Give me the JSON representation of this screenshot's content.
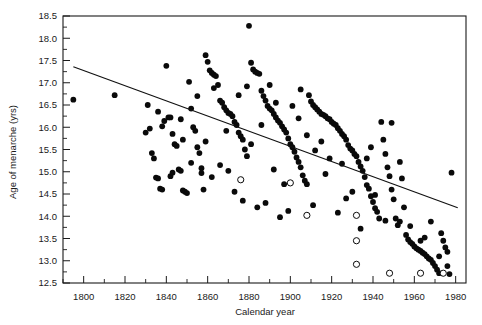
{
  "chart_data": {
    "type": "scatter",
    "title": "",
    "xlabel": "Calendar year",
    "ylabel": "Age of menarche (yrs)",
    "xlim": [
      1790,
      1985
    ],
    "ylim": [
      12.5,
      18.5
    ],
    "xticks": [
      1800,
      1820,
      1840,
      1860,
      1880,
      1900,
      1920,
      1940,
      1960,
      1980
    ],
    "xtick_labels": [
      "1800",
      "1820",
      "1840",
      "1860",
      "1880",
      "1900",
      "1920",
      "1940",
      "1960",
      "1980"
    ],
    "xminor_step": 10,
    "yticks": [
      12.5,
      13.0,
      13.5,
      14.0,
      14.5,
      15.0,
      15.5,
      16.0,
      16.5,
      17.0,
      17.5,
      18.0,
      18.5
    ],
    "ytick_labels": [
      "12.5",
      "13.0",
      "13.5",
      "14.0",
      "14.5",
      "15.0",
      "15.5",
      "16.0",
      "16.5",
      "17.0",
      "17.5",
      "18.0",
      "18.5"
    ],
    "grid": false,
    "legend": "none",
    "marker_colors": {
      "filled": "#0a0a0a",
      "open_fill": "#ffffff",
      "open_stroke": "#0a0a0a",
      "line": "#111111"
    },
    "trend_line": {
      "label": "linear regression fit",
      "x_start": 1795,
      "y_start": 17.36,
      "x_end": 1981,
      "y_end": 14.19
    },
    "series": [
      {
        "name": "filled-circles",
        "marker": "filled-circle",
        "points": [
          [
            1795,
            16.62
          ],
          [
            1815,
            16.72
          ],
          [
            1831,
            16.5
          ],
          [
            1832,
            15.97
          ],
          [
            1833,
            15.42
          ],
          [
            1834,
            15.3
          ],
          [
            1835,
            14.87
          ],
          [
            1836,
            14.85
          ],
          [
            1837,
            14.62
          ],
          [
            1838,
            14.6
          ],
          [
            1839,
            16.14
          ],
          [
            1840,
            17.38
          ],
          [
            1841,
            16.22
          ],
          [
            1842,
            16.22
          ],
          [
            1843,
            15.85
          ],
          [
            1844,
            15.62
          ],
          [
            1845,
            15.58
          ],
          [
            1846,
            15.05
          ],
          [
            1847,
            15.02
          ],
          [
            1848,
            14.58
          ],
          [
            1849,
            14.55
          ],
          [
            1850,
            14.52
          ],
          [
            1851,
            17.02
          ],
          [
            1852,
            16.42
          ],
          [
            1853,
            16.0
          ],
          [
            1854,
            15.92
          ],
          [
            1855,
            15.55
          ],
          [
            1856,
            15.42
          ],
          [
            1857,
            14.97
          ],
          [
            1858,
            14.6
          ],
          [
            1859,
            17.62
          ],
          [
            1860,
            17.47
          ],
          [
            1861,
            17.28
          ],
          [
            1862,
            17.22
          ],
          [
            1863,
            17.18
          ],
          [
            1864,
            17.15
          ],
          [
            1865,
            16.95
          ],
          [
            1866,
            16.6
          ],
          [
            1867,
            16.55
          ],
          [
            1868,
            16.45
          ],
          [
            1869,
            16.38
          ],
          [
            1870,
            16.32
          ],
          [
            1871,
            16.3
          ],
          [
            1872,
            16.25
          ],
          [
            1873,
            16.12
          ],
          [
            1874,
            16.05
          ],
          [
            1875,
            15.88
          ],
          [
            1876,
            15.8
          ],
          [
            1877,
            15.72
          ],
          [
            1878,
            15.5
          ],
          [
            1879,
            15.35
          ],
          [
            1880,
            18.28
          ],
          [
            1881,
            17.45
          ],
          [
            1882,
            17.3
          ],
          [
            1883,
            17.25
          ],
          [
            1884,
            17.22
          ],
          [
            1885,
            17.2
          ],
          [
            1886,
            16.82
          ],
          [
            1887,
            16.7
          ],
          [
            1888,
            16.6
          ],
          [
            1889,
            16.48
          ],
          [
            1890,
            16.42
          ],
          [
            1891,
            16.38
          ],
          [
            1892,
            16.3
          ],
          [
            1893,
            16.22
          ],
          [
            1894,
            16.15
          ],
          [
            1895,
            16.1
          ],
          [
            1896,
            16.02
          ],
          [
            1897,
            15.95
          ],
          [
            1898,
            15.88
          ],
          [
            1899,
            15.75
          ],
          [
            1900,
            15.62
          ],
          [
            1901,
            15.55
          ],
          [
            1902,
            15.45
          ],
          [
            1903,
            15.32
          ],
          [
            1904,
            15.22
          ],
          [
            1905,
            15.1
          ],
          [
            1906,
            14.92
          ],
          [
            1907,
            14.8
          ],
          [
            1908,
            14.72
          ],
          [
            1909,
            16.72
          ],
          [
            1910,
            16.58
          ],
          [
            1911,
            16.5
          ],
          [
            1912,
            16.45
          ],
          [
            1913,
            16.4
          ],
          [
            1914,
            16.35
          ],
          [
            1915,
            16.3
          ],
          [
            1916,
            16.28
          ],
          [
            1917,
            16.25
          ],
          [
            1918,
            16.2
          ],
          [
            1919,
            16.18
          ],
          [
            1920,
            16.12
          ],
          [
            1921,
            16.08
          ],
          [
            1922,
            16.05
          ],
          [
            1923,
            15.98
          ],
          [
            1924,
            15.92
          ],
          [
            1925,
            15.85
          ],
          [
            1926,
            15.8
          ],
          [
            1927,
            15.72
          ],
          [
            1928,
            15.6
          ],
          [
            1929,
            15.52
          ],
          [
            1930,
            15.48
          ],
          [
            1931,
            15.4
          ],
          [
            1932,
            15.35
          ],
          [
            1933,
            15.22
          ],
          [
            1934,
            15.12
          ],
          [
            1935,
            15.02
          ],
          [
            1936,
            14.88
          ],
          [
            1937,
            14.7
          ],
          [
            1938,
            14.62
          ],
          [
            1939,
            14.45
          ],
          [
            1940,
            14.32
          ],
          [
            1941,
            14.18
          ],
          [
            1942,
            14.1
          ],
          [
            1943,
            13.95
          ],
          [
            1944,
            16.12
          ],
          [
            1945,
            15.72
          ],
          [
            1946,
            15.4
          ],
          [
            1947,
            15.1
          ],
          [
            1948,
            14.9
          ],
          [
            1949,
            14.6
          ],
          [
            1950,
            14.38
          ],
          [
            1951,
            13.95
          ],
          [
            1952,
            13.8
          ],
          [
            1953,
            15.22
          ],
          [
            1954,
            14.85
          ],
          [
            1955,
            14.2
          ],
          [
            1956,
            13.58
          ],
          [
            1957,
            13.48
          ],
          [
            1958,
            13.42
          ],
          [
            1959,
            13.38
          ],
          [
            1960,
            13.32
          ],
          [
            1961,
            13.28
          ],
          [
            1962,
            13.25
          ],
          [
            1963,
            13.22
          ],
          [
            1964,
            13.18
          ],
          [
            1965,
            13.15
          ],
          [
            1966,
            13.1
          ],
          [
            1967,
            13.05
          ],
          [
            1968,
            13.02
          ],
          [
            1969,
            12.95
          ],
          [
            1970,
            12.88
          ],
          [
            1971,
            12.8
          ],
          [
            1972,
            12.72
          ],
          [
            1973,
            13.62
          ],
          [
            1974,
            13.45
          ],
          [
            1975,
            13.3
          ],
          [
            1976,
            13.2
          ],
          [
            1977,
            12.7
          ],
          [
            1978,
            14.98
          ],
          [
            1830,
            15.88
          ],
          [
            1842,
            14.9
          ],
          [
            1855,
            16.7
          ],
          [
            1866,
            15.15
          ],
          [
            1877,
            14.35
          ],
          [
            1888,
            14.3
          ],
          [
            1899,
            14.12
          ],
          [
            1905,
            16.85
          ],
          [
            1911,
            14.25
          ],
          [
            1923,
            14.08
          ],
          [
            1934,
            13.72
          ],
          [
            1946,
            13.9
          ],
          [
            1862,
            14.88
          ],
          [
            1873,
            14.55
          ],
          [
            1884,
            14.2
          ],
          [
            1895,
            13.98
          ],
          [
            1852,
            15.2
          ],
          [
            1869,
            15.92
          ],
          [
            1892,
            15.05
          ],
          [
            1917,
            14.95
          ],
          [
            1838,
            16.02
          ],
          [
            1848,
            15.72
          ],
          [
            1857,
            15.08
          ],
          [
            1875,
            16.72
          ],
          [
            1886,
            16.05
          ],
          [
            1897,
            14.72
          ],
          [
            1908,
            15.82
          ],
          [
            1919,
            15.3
          ],
          [
            1930,
            14.55
          ],
          [
            1941,
            14.48
          ],
          [
            1953,
            13.88
          ],
          [
            1965,
            13.52
          ],
          [
            1843,
            14.98
          ],
          [
            1863,
            16.88
          ],
          [
            1879,
            16.92
          ],
          [
            1890,
            16.95
          ],
          [
            1901,
            16.48
          ],
          [
            1912,
            15.48
          ],
          [
            1925,
            15.18
          ],
          [
            1937,
            15.3
          ],
          [
            1949,
            16.1
          ],
          [
            1968,
            13.88
          ],
          [
            1972,
            13.1
          ],
          [
            1976,
            12.88
          ],
          [
            1836,
            16.35
          ],
          [
            1847,
            16.18
          ],
          [
            1859,
            15.68
          ],
          [
            1870,
            15.02
          ],
          [
            1881,
            15.62
          ],
          [
            1893,
            16.55
          ],
          [
            1904,
            16.2
          ],
          [
            1915,
            15.68
          ],
          [
            1927,
            14.4
          ],
          [
            1939,
            15.55
          ],
          [
            1958,
            13.78
          ],
          [
            1963,
            13.45
          ]
        ]
      },
      {
        "name": "open-circles",
        "marker": "open-circle",
        "points": [
          [
            1876,
            14.82
          ],
          [
            1900,
            14.75
          ],
          [
            1908,
            14.02
          ],
          [
            1932,
            14.02
          ],
          [
            1932,
            13.45
          ],
          [
            1932,
            12.92
          ],
          [
            1948,
            12.72
          ],
          [
            1963,
            12.72
          ],
          [
            1974,
            12.72
          ]
        ]
      }
    ]
  },
  "axes": {
    "x_title": "Calendar year",
    "y_title": "Age of menarche (yrs)"
  }
}
